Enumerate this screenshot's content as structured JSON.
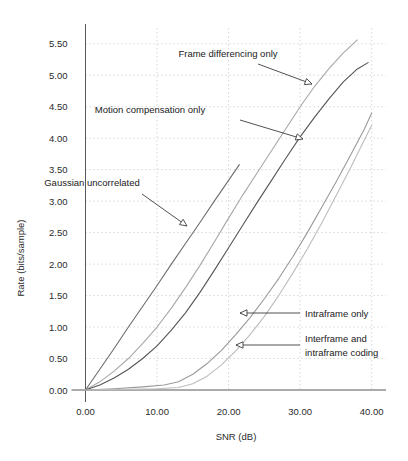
{
  "chart_data": {
    "type": "line",
    "title": "",
    "xlabel": "SNR (dB)",
    "ylabel": "Rate (bits/sample)",
    "xlim": [
      0,
      42
    ],
    "ylim": [
      0,
      5.75
    ],
    "xticks": [
      "0.00",
      "10.00",
      "20.00",
      "30.00",
      "40.00"
    ],
    "xtick_values": [
      0,
      10,
      20,
      30,
      40
    ],
    "yticks": [
      "0.00",
      "0.50",
      "1.00",
      "1.50",
      "2.00",
      "2.50",
      "3.00",
      "3.50",
      "4.00",
      "4.50",
      "5.00",
      "5.50"
    ],
    "ytick_values": [
      0,
      0.5,
      1.0,
      1.5,
      2.0,
      2.5,
      3.0,
      3.5,
      4.0,
      4.5,
      5.0,
      5.5
    ],
    "grid": "dotted-horizontal-and-vertical",
    "legend_position": "inline-annotations",
    "series": [
      {
        "name": "Gaussian uncorrelated",
        "color": "#6d6d6d",
        "points": [
          [
            0,
            0
          ],
          [
            2,
            0.33
          ],
          [
            4,
            0.66
          ],
          [
            6,
            1.0
          ],
          [
            8,
            1.33
          ],
          [
            10,
            1.66
          ],
          [
            12,
            2.0
          ],
          [
            14,
            2.33
          ],
          [
            16,
            2.66
          ],
          [
            18,
            3.0
          ],
          [
            20,
            3.33
          ],
          [
            21.5,
            3.58
          ]
        ]
      },
      {
        "name": "Frame differencing only",
        "color": "#a8a8a8",
        "points": [
          [
            0,
            0
          ],
          [
            2,
            0.13
          ],
          [
            4,
            0.3
          ],
          [
            6,
            0.5
          ],
          [
            8,
            0.74
          ],
          [
            10,
            1.0
          ],
          [
            12,
            1.3
          ],
          [
            14,
            1.63
          ],
          [
            16,
            1.98
          ],
          [
            18,
            2.35
          ],
          [
            20,
            2.73
          ],
          [
            22,
            3.1
          ],
          [
            24,
            3.45
          ],
          [
            26,
            3.8
          ],
          [
            28,
            4.15
          ],
          [
            30,
            4.5
          ],
          [
            32,
            4.82
          ],
          [
            34,
            5.1
          ],
          [
            36,
            5.35
          ],
          [
            38,
            5.56
          ]
        ]
      },
      {
        "name": "Motion compensation only",
        "color": "#555555",
        "points": [
          [
            0,
            0
          ],
          [
            2,
            0.08
          ],
          [
            4,
            0.19
          ],
          [
            6,
            0.33
          ],
          [
            8,
            0.5
          ],
          [
            10,
            0.7
          ],
          [
            12,
            0.95
          ],
          [
            14,
            1.23
          ],
          [
            16,
            1.55
          ],
          [
            18,
            1.9
          ],
          [
            20,
            2.26
          ],
          [
            22,
            2.62
          ],
          [
            24,
            2.98
          ],
          [
            26,
            3.33
          ],
          [
            28,
            3.68
          ],
          [
            30,
            4.02
          ],
          [
            32,
            4.33
          ],
          [
            34,
            4.62
          ],
          [
            36,
            4.89
          ],
          [
            38,
            5.1
          ],
          [
            39.5,
            5.2
          ]
        ]
      },
      {
        "name": "Intraframe only",
        "color": "#9a9a9a",
        "points": [
          [
            0,
            0
          ],
          [
            4,
            0.02
          ],
          [
            8,
            0.05
          ],
          [
            11,
            0.08
          ],
          [
            13,
            0.13
          ],
          [
            15,
            0.25
          ],
          [
            17,
            0.42
          ],
          [
            19,
            0.63
          ],
          [
            21,
            0.88
          ],
          [
            23,
            1.15
          ],
          [
            25,
            1.45
          ],
          [
            27,
            1.77
          ],
          [
            29,
            2.12
          ],
          [
            31,
            2.5
          ],
          [
            33,
            2.9
          ],
          [
            35,
            3.3
          ],
          [
            37,
            3.72
          ],
          [
            39,
            4.15
          ],
          [
            40,
            4.4
          ]
        ]
      },
      {
        "name": "Interframe and intraframe coding",
        "color": "#bdbdbd",
        "points": [
          [
            0,
            0
          ],
          [
            6,
            0.01
          ],
          [
            10,
            0.02
          ],
          [
            13,
            0.04
          ],
          [
            15,
            0.1
          ],
          [
            17,
            0.22
          ],
          [
            19,
            0.4
          ],
          [
            21,
            0.62
          ],
          [
            23,
            0.88
          ],
          [
            25,
            1.17
          ],
          [
            27,
            1.5
          ],
          [
            29,
            1.86
          ],
          [
            31,
            2.24
          ],
          [
            33,
            2.65
          ],
          [
            35,
            3.08
          ],
          [
            37,
            3.52
          ],
          [
            39,
            3.98
          ],
          [
            40,
            4.2
          ]
        ]
      }
    ],
    "annotations": [
      {
        "id": "frame-differencing-only",
        "text": "Frame differencing only",
        "text_x": 228,
        "text_y": 57,
        "arrow": [
          [
            258,
            64
          ],
          [
            312,
            84
          ]
        ]
      },
      {
        "id": "motion-compensation-only",
        "text": "Motion compensation only",
        "text_x": 150,
        "text_y": 113,
        "arrow": [
          [
            240,
            120
          ],
          [
            303,
            139
          ]
        ]
      },
      {
        "id": "gaussian-uncorrelated",
        "text": "Gaussian uncorrelated",
        "text_x": 92,
        "text_y": 186,
        "arrow": [
          [
            142,
            194
          ],
          [
            187,
            226
          ]
        ]
      },
      {
        "id": "intraframe-only",
        "text": "Intraframe only",
        "text_x": 305,
        "text_y": 317,
        "arrow": [
          [
            300,
            313
          ],
          [
            240,
            313
          ]
        ]
      },
      {
        "id": "interframe-and-intraframe-coding",
        "text": "Interframe and",
        "text2": "intraframe coding",
        "text_x": 305,
        "text_y": 342,
        "arrow": [
          [
            300,
            345
          ],
          [
            236,
            345
          ]
        ]
      }
    ]
  }
}
